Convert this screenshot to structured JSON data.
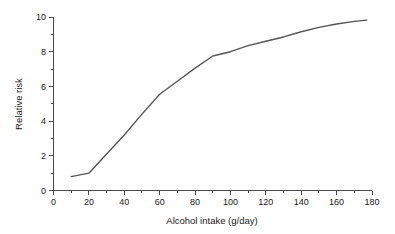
{
  "chart_data": {
    "type": "line",
    "title": "",
    "xlabel": "Alcohol intake (g/day)",
    "ylabel": "Relative risk",
    "xlim": [
      0,
      180
    ],
    "ylim": [
      0,
      10
    ],
    "grid": false,
    "legend": null,
    "x_major_ticks": [
      0,
      20,
      40,
      60,
      80,
      100,
      120,
      140,
      160,
      180
    ],
    "x_minor_ticks": [
      10,
      30,
      50,
      70,
      90,
      110,
      130,
      150,
      170
    ],
    "y_major_ticks": [
      0,
      2,
      4,
      6,
      8,
      10
    ],
    "y_minor_ticks": [
      1,
      3,
      5,
      7,
      9
    ],
    "x_tick_labels": [
      "0",
      "20",
      "40",
      "60",
      "80",
      "100",
      "120",
      "140",
      "160",
      "180"
    ],
    "y_tick_labels": [
      "0",
      "2",
      "4",
      "6",
      "8",
      "10"
    ],
    "series": [
      {
        "name": "Relative risk",
        "color": "#555555",
        "x": [
          10,
          20,
          30,
          40,
          50,
          60,
          70,
          80,
          90,
          100,
          110,
          120,
          130,
          140,
          150,
          160,
          170,
          177
        ],
        "values": [
          0.8,
          1.0,
          2.1,
          3.2,
          4.4,
          5.55,
          6.3,
          7.05,
          7.75,
          8.0,
          8.35,
          8.6,
          8.85,
          9.15,
          9.4,
          9.6,
          9.75,
          9.82
        ]
      }
    ]
  },
  "axis_colors": {
    "axis": "#4a4a4a",
    "text": "#1a1a1a",
    "curve": "#555555",
    "background": "#ffffff"
  }
}
